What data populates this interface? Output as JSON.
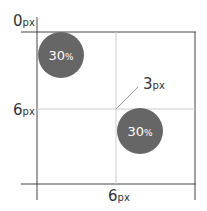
{
  "diagram": {
    "colors": {
      "frame_line": "#444444",
      "grid_line": "#cccccc",
      "circle_fill": "#666666",
      "circle_text": "#ffffff",
      "label_text": "#333333"
    },
    "labels": {
      "origin": {
        "num": "0",
        "unit": "px"
      },
      "left_mid": {
        "num": "6",
        "unit": "px"
      },
      "bottom_mid": {
        "num": "6",
        "unit": "px"
      },
      "callout": {
        "num": "3",
        "unit": "px"
      }
    },
    "circles": [
      {
        "num": "30",
        "unit": "%"
      },
      {
        "num": "30",
        "unit": "%"
      }
    ]
  }
}
